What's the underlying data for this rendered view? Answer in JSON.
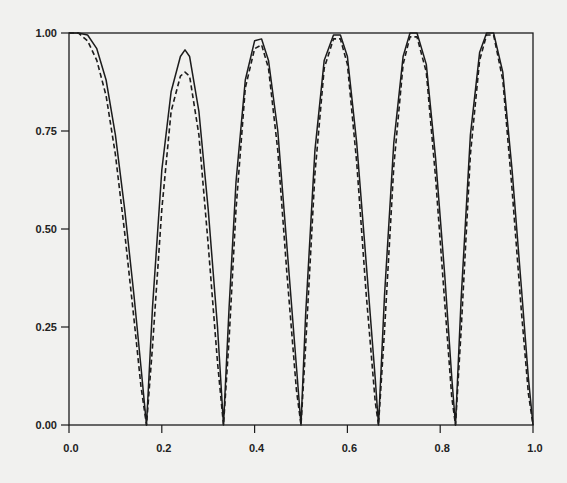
{
  "chart_data": {
    "type": "line",
    "title": "",
    "xlabel": "",
    "ylabel": "",
    "xlim": [
      0.0,
      1.0
    ],
    "ylim": [
      0.0,
      1.0
    ],
    "grid": false,
    "legend": null,
    "x_ticks": [
      "0.0",
      "0.2",
      "0.4",
      "0.6",
      "0.8",
      "1.0"
    ],
    "y_ticks": [
      "0.00",
      "0.25",
      "0.50",
      "0.75",
      "1.00"
    ],
    "series": [
      {
        "name": "solid",
        "style": "solid",
        "x": [
          0.0,
          0.02,
          0.04,
          0.06,
          0.08,
          0.1,
          0.12,
          0.14,
          0.155,
          0.167,
          0.18,
          0.2,
          0.22,
          0.24,
          0.25,
          0.26,
          0.28,
          0.3,
          0.32,
          0.333,
          0.345,
          0.36,
          0.38,
          0.4,
          0.415,
          0.43,
          0.45,
          0.47,
          0.49,
          0.5,
          0.51,
          0.53,
          0.55,
          0.57,
          0.585,
          0.6,
          0.62,
          0.64,
          0.66,
          0.667,
          0.68,
          0.7,
          0.72,
          0.735,
          0.75,
          0.77,
          0.79,
          0.81,
          0.825,
          0.833,
          0.845,
          0.865,
          0.885,
          0.9,
          0.915,
          0.935,
          0.955,
          0.975,
          0.99,
          1.0
        ],
        "y": [
          1.0,
          1.0,
          0.995,
          0.96,
          0.88,
          0.74,
          0.55,
          0.33,
          0.15,
          0.0,
          0.3,
          0.65,
          0.85,
          0.94,
          0.957,
          0.94,
          0.8,
          0.55,
          0.25,
          0.0,
          0.3,
          0.62,
          0.88,
          0.98,
          0.985,
          0.93,
          0.75,
          0.45,
          0.15,
          0.0,
          0.28,
          0.7,
          0.93,
          0.995,
          0.995,
          0.94,
          0.72,
          0.42,
          0.12,
          0.0,
          0.33,
          0.72,
          0.94,
          1.0,
          1.0,
          0.92,
          0.68,
          0.38,
          0.12,
          0.0,
          0.32,
          0.74,
          0.95,
          1.0,
          1.0,
          0.9,
          0.65,
          0.35,
          0.12,
          0.0
        ]
      },
      {
        "name": "dashed",
        "style": "dashed",
        "x": [
          0.0,
          0.02,
          0.04,
          0.06,
          0.08,
          0.1,
          0.12,
          0.14,
          0.155,
          0.167,
          0.18,
          0.2,
          0.22,
          0.24,
          0.25,
          0.26,
          0.28,
          0.3,
          0.32,
          0.333,
          0.345,
          0.36,
          0.38,
          0.4,
          0.415,
          0.43,
          0.45,
          0.47,
          0.49,
          0.5,
          0.51,
          0.53,
          0.55,
          0.57,
          0.585,
          0.6,
          0.62,
          0.64,
          0.66,
          0.667,
          0.68,
          0.7,
          0.72,
          0.735,
          0.75,
          0.77,
          0.79,
          0.81,
          0.825,
          0.833,
          0.845,
          0.865,
          0.885,
          0.9,
          0.915,
          0.935,
          0.955,
          0.975,
          0.99,
          1.0
        ],
        "y": [
          1.0,
          1.0,
          0.98,
          0.93,
          0.84,
          0.69,
          0.49,
          0.27,
          0.1,
          0.0,
          0.2,
          0.55,
          0.8,
          0.89,
          0.9,
          0.89,
          0.74,
          0.46,
          0.16,
          0.0,
          0.22,
          0.55,
          0.86,
          0.96,
          0.97,
          0.91,
          0.7,
          0.38,
          0.09,
          0.0,
          0.2,
          0.64,
          0.91,
          0.985,
          0.985,
          0.92,
          0.67,
          0.34,
          0.06,
          0.0,
          0.24,
          0.66,
          0.92,
          0.99,
          0.99,
          0.9,
          0.63,
          0.31,
          0.07,
          0.0,
          0.24,
          0.69,
          0.93,
          0.995,
          0.995,
          0.88,
          0.6,
          0.29,
          0.08,
          0.0
        ]
      }
    ]
  },
  "layout": {
    "plot": {
      "left": 69,
      "right": 533,
      "top": 33,
      "bottom": 425
    },
    "colors": {
      "background": "#f1f1ef",
      "ink": "#1c1c1c"
    }
  }
}
